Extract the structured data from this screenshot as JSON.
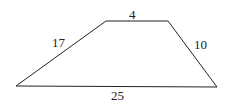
{
  "diagram": {
    "shape": "trapezoid",
    "stroke_color": "#222222",
    "vertices": [
      [
        16,
        86
      ],
      [
        106,
        21
      ],
      [
        168,
        21
      ],
      [
        217,
        87
      ]
    ],
    "labels": {
      "top": "4",
      "left": "17",
      "right": "10",
      "bottom": "25"
    }
  }
}
